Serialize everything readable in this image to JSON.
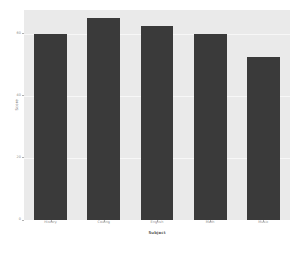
{
  "chart_data": {
    "type": "bar",
    "title": "",
    "xlabel": "Subject",
    "ylabel": "Score",
    "categories": [
      "History",
      "Coding",
      "English",
      "Math",
      "Music"
    ],
    "values": [
      60,
      65,
      62.5,
      60,
      52.5
    ],
    "ylim": [
      0,
      67.7
    ],
    "yticks": [
      0,
      20,
      40,
      60
    ],
    "ytick_labels": [
      "0",
      "20",
      "40",
      "60"
    ],
    "grid": true,
    "legend": "none",
    "bar_color": "#3a3a3a",
    "panel_color": "#eaeaea",
    "grid_color": "#f7f7f7",
    "tick_label_color": "#8a8a8a",
    "axis_label_color": "#5d5d5d"
  }
}
